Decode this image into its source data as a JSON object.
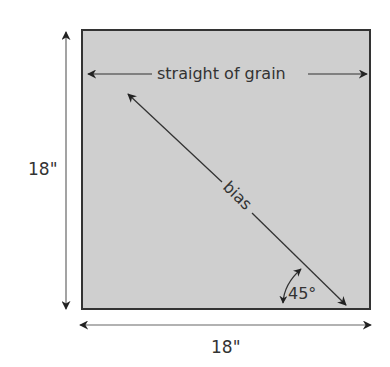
{
  "diagram": {
    "title_fragment": "",
    "square": {
      "fill": "#cfcfcf",
      "stroke": "#333333"
    },
    "labels": {
      "grain": "straight of grain",
      "bias": "bias",
      "angle": "45°",
      "height": "18\"",
      "width": "18\""
    },
    "colors": {
      "ink": "#333333",
      "dim_line": "#555555"
    }
  }
}
